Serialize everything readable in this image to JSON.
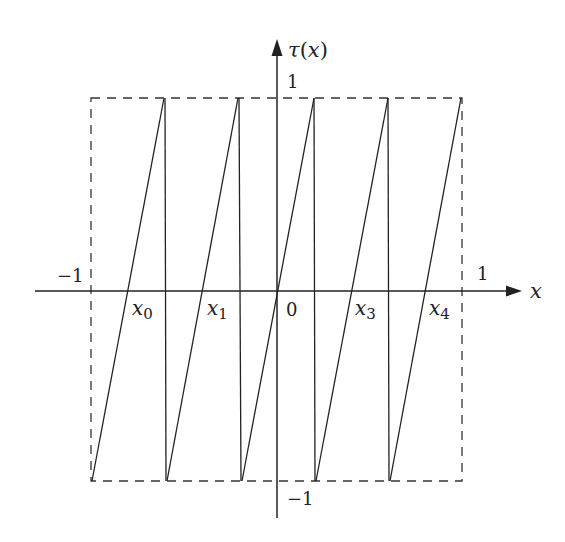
{
  "diagram": {
    "axes": {
      "x_label": "x",
      "y_label_func": "τ",
      "y_label_arg": "(x)",
      "x_ticks": {
        "left": "−1",
        "right": "1"
      },
      "y_ticks": {
        "top": "1",
        "bottom": "−1"
      },
      "origin_label": "0"
    },
    "points": [
      {
        "var": "x",
        "sub": "0"
      },
      {
        "var": "x",
        "sub": "1"
      },
      {
        "var": "x",
        "sub": "3"
      },
      {
        "var": "x",
        "sub": "4"
      }
    ],
    "bounding_box": {
      "style": "dashed",
      "x_range": [
        -1,
        1
      ],
      "y_range": [
        -1,
        1
      ]
    },
    "segments_count": 5,
    "colors": {
      "line": "#222222",
      "background": "#ffffff"
    }
  }
}
